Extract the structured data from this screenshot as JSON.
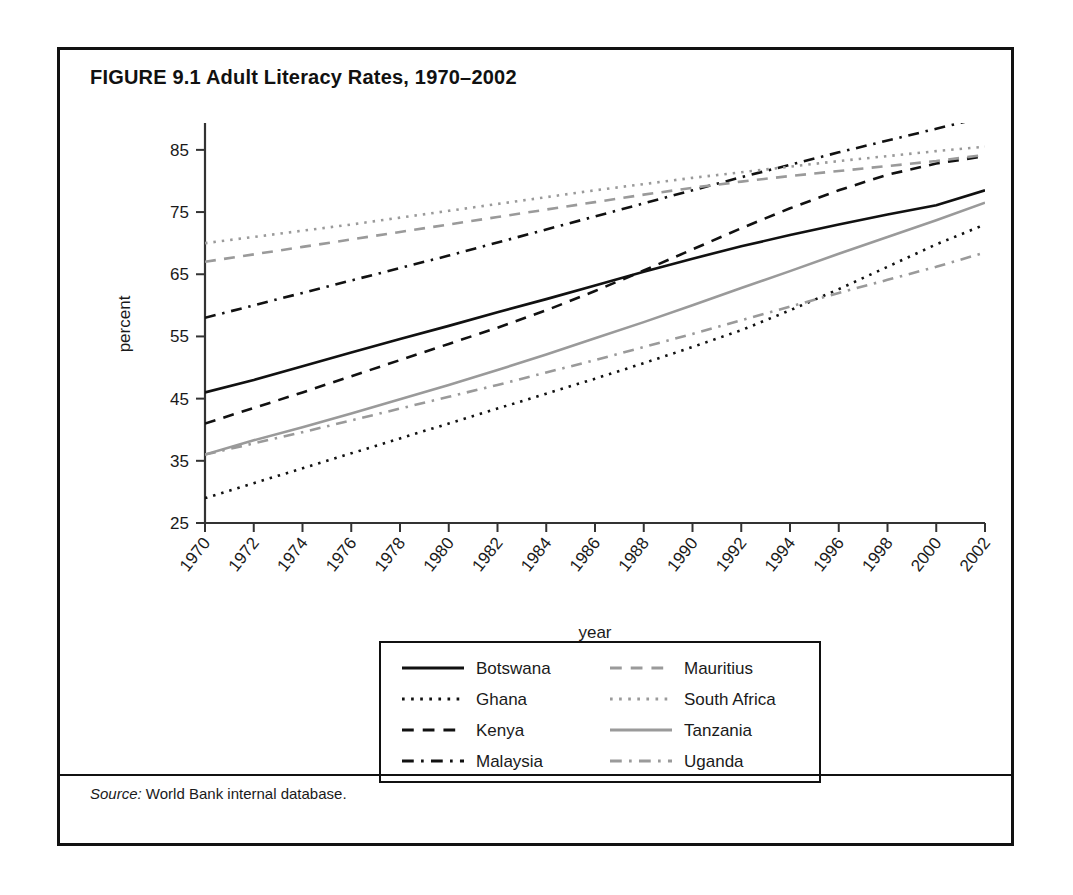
{
  "figure": {
    "title": "FIGURE 9.1  Adult Literacy Rates, 1970–2002",
    "source_label": "Source:",
    "source_text": " World Bank internal database."
  },
  "chart_data": {
    "type": "line",
    "title": "FIGURE 9.1  Adult Literacy Rates, 1970–2002",
    "xlabel": "year",
    "ylabel": "percent",
    "xlim": [
      1970,
      2002
    ],
    "ylim": [
      25,
      89
    ],
    "grid": false,
    "legend_position": "bottom-center",
    "xticks": [
      1970,
      1972,
      1974,
      1976,
      1978,
      1980,
      1982,
      1984,
      1986,
      1988,
      1990,
      1992,
      1994,
      1996,
      1998,
      2000,
      2002
    ],
    "yticks": [
      25,
      35,
      45,
      55,
      65,
      75,
      85
    ],
    "x": [
      1970,
      1972,
      1974,
      1976,
      1978,
      1980,
      1982,
      1984,
      1986,
      1988,
      1990,
      1992,
      1994,
      1996,
      1998,
      2000,
      2002
    ],
    "series": [
      {
        "name": "Botswana",
        "color": "#111111",
        "style": "solid",
        "values": [
          46.0,
          48.0,
          50.2,
          52.4,
          54.6,
          56.7,
          58.9,
          61.0,
          63.2,
          65.4,
          67.5,
          69.5,
          71.3,
          73.0,
          74.6,
          76.1,
          78.5
        ]
      },
      {
        "name": "Ghana",
        "color": "#111111",
        "style": "dotted",
        "values": [
          29.0,
          31.4,
          33.8,
          36.2,
          38.6,
          41.0,
          43.4,
          45.8,
          48.2,
          50.7,
          53.3,
          56.0,
          59.2,
          62.6,
          66.2,
          69.8,
          73.0
        ]
      },
      {
        "name": "Kenya",
        "color": "#111111",
        "style": "dashed",
        "values": [
          41.0,
          43.5,
          46.0,
          48.6,
          51.2,
          53.8,
          56.4,
          59.2,
          62.3,
          65.6,
          69.0,
          72.4,
          75.6,
          78.5,
          81.0,
          82.8,
          84.0
        ]
      },
      {
        "name": "Malaysia",
        "color": "#111111",
        "style": "dashdot",
        "values": [
          58.0,
          60.0,
          62.0,
          64.0,
          66.0,
          68.0,
          70.1,
          72.2,
          74.3,
          76.4,
          78.5,
          80.6,
          82.6,
          84.6,
          86.5,
          88.4,
          null
        ]
      },
      {
        "name": "Mauritius",
        "color": "#9a9a9a",
        "style": "dashed",
        "values": [
          67.0,
          68.2,
          69.4,
          70.6,
          71.8,
          73.0,
          74.2,
          75.4,
          76.6,
          77.8,
          78.9,
          79.9,
          80.8,
          81.6,
          82.4,
          83.2,
          84.2
        ]
      },
      {
        "name": "South Africa",
        "color": "#9a9a9a",
        "style": "dotted",
        "values": [
          70.0,
          71.0,
          72.0,
          73.0,
          74.1,
          75.2,
          76.3,
          77.4,
          78.5,
          79.5,
          80.5,
          81.4,
          82.3,
          83.2,
          84.0,
          84.8,
          85.5
        ]
      },
      {
        "name": "Tanzania",
        "color": "#9a9a9a",
        "style": "solid",
        "values": [
          36.0,
          38.3,
          40.4,
          42.6,
          44.9,
          47.2,
          49.6,
          52.1,
          54.7,
          57.3,
          60.0,
          62.8,
          65.5,
          68.3,
          71.0,
          73.7,
          76.5
        ]
      },
      {
        "name": "Uganda",
        "color": "#9a9a9a",
        "style": "dashdot",
        "values": [
          36.0,
          37.8,
          39.6,
          41.5,
          43.4,
          45.3,
          47.2,
          49.2,
          51.2,
          53.3,
          55.4,
          57.6,
          59.8,
          62.0,
          64.1,
          66.2,
          68.5
        ]
      }
    ]
  },
  "legend": {
    "items": [
      {
        "label": "Botswana",
        "color": "#111111",
        "style": "solid"
      },
      {
        "label": "Ghana",
        "color": "#111111",
        "style": "dotted"
      },
      {
        "label": "Kenya",
        "color": "#111111",
        "style": "dashed"
      },
      {
        "label": "Malaysia",
        "color": "#111111",
        "style": "dashdot"
      },
      {
        "label": "Mauritius",
        "color": "#9a9a9a",
        "style": "dashed"
      },
      {
        "label": "South Africa",
        "color": "#9a9a9a",
        "style": "dotted"
      },
      {
        "label": "Tanzania",
        "color": "#9a9a9a",
        "style": "solid"
      },
      {
        "label": "Uganda",
        "color": "#9a9a9a",
        "style": "dashdot"
      }
    ]
  }
}
